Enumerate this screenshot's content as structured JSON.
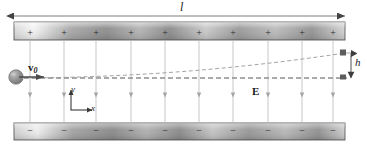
{
  "figure": {
    "background_color": "#ffffff"
  },
  "labels": {
    "length": "l",
    "deflection": "h",
    "field": "E",
    "velocity_symbol": "v",
    "velocity_subscript": "0",
    "axis_y": "y",
    "axis_x": "x"
  },
  "plates": {
    "top": {
      "polarity": "+",
      "sign_count": 10,
      "signs": [
        "+",
        "+",
        "+",
        "+",
        "+",
        "+",
        "+",
        "+",
        "+",
        "+"
      ],
      "x_start": 14,
      "x_end": 345,
      "y_top": 22,
      "y_bottom": 40,
      "fill_light": "#f2f2f2",
      "fill_dark": "#8f8f8f",
      "stroke": "#555555"
    },
    "bottom": {
      "polarity": "−",
      "sign_count": 10,
      "signs": [
        "−",
        "−",
        "−",
        "−",
        "−",
        "−",
        "−",
        "−",
        "−",
        "−"
      ],
      "x_start": 14,
      "x_end": 345,
      "y_top": 123,
      "y_bottom": 140,
      "fill_light": "#f2f2f2",
      "fill_dark": "#8f8f8f",
      "stroke": "#555555"
    }
  },
  "field_lines": {
    "count": 10,
    "x_positions": [
      30,
      64,
      96,
      131,
      165,
      199,
      233,
      268,
      302,
      333
    ],
    "y_start": 40,
    "y_end": 123,
    "direction": "down",
    "color": "#b9b9b9"
  },
  "particle": {
    "shape": "sphere",
    "cx": 16,
    "cy": 77,
    "r": 7,
    "fill": "#8a8a8a",
    "highlight": "#c9c9c9"
  },
  "velocity_arrow": {
    "x_start": 20,
    "x_end": 44,
    "y": 77,
    "color": "#4a4a4a"
  },
  "dimension_length": {
    "y": 16,
    "x_start": 14,
    "x_end": 345,
    "color": "#555555"
  },
  "dimension_height": {
    "x": 351,
    "y_top": 53,
    "y_bottom": 78,
    "color": "#444444"
  },
  "reference_line": {
    "x_start": 24,
    "x_end": 347,
    "y": 78,
    "style": "dashed",
    "color": "#8f8f8f"
  },
  "trajectory": {
    "style": "dashed",
    "color": "#9a9a9a",
    "start": {
      "x": 24,
      "y": 78
    },
    "end": {
      "x": 345,
      "y": 53
    },
    "path": "M24,78 C130,77 230,70 345,53"
  },
  "axes": {
    "origin": {
      "x": 71,
      "y": 110
    },
    "y_axis_top": 90,
    "x_axis_right": 92,
    "color": "#3a3a3a"
  },
  "colors": {
    "plate_stroke": "#555555",
    "field_line": "#b9b9b9",
    "dashed": "#9a9a9a",
    "text": "#1a1a1a"
  }
}
